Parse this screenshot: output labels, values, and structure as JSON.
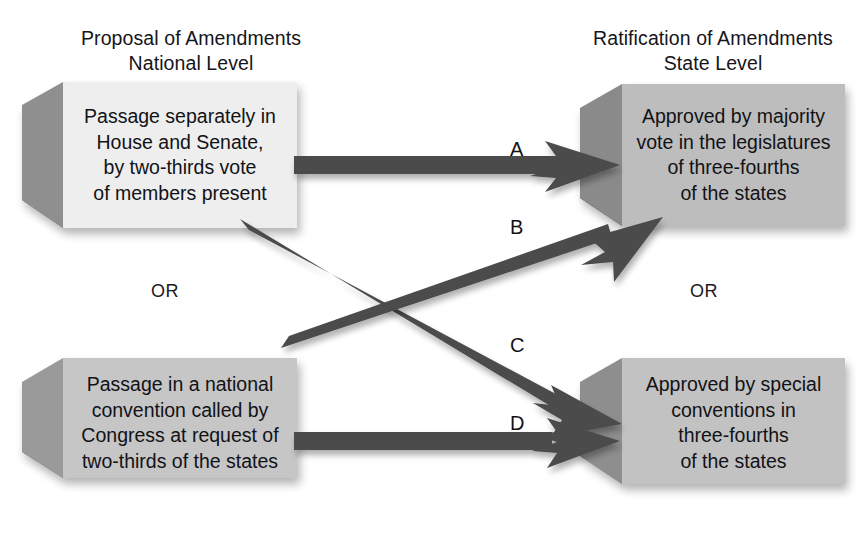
{
  "diagram": {
    "headers": {
      "left": "Proposal of Amendments\nNational Level",
      "right": "Ratification of Amendments\nState Level"
    },
    "connectors": {
      "or_left": "OR",
      "or_right": "OR"
    },
    "boxes": [
      {
        "id": "proposal-congress",
        "side": "left",
        "position": "top",
        "text": "Passage separately in\nHouse and Senate,\nby two-thirds vote\nof members present",
        "face_color": "#eeeeee",
        "side_color": "#8f8f8f",
        "bottom_color": "#4a4a4a"
      },
      {
        "id": "proposal-convention",
        "side": "left",
        "position": "bottom",
        "text": "Passage in a national\nconvention called by\nCongress at request of\ntwo-thirds of the states",
        "face_color": "#c6c6c6",
        "side_color": "#9a9a9a",
        "bottom_color": "#5a5a5a"
      },
      {
        "id": "ratification-legislatures",
        "side": "right",
        "position": "top",
        "text": "Approved by majority\nvote in the legislatures\nof three-fourths\nof the states",
        "face_color": "#bdbdbd",
        "side_color": "#8a8a8a",
        "bottom_color": "#3f3f3f"
      },
      {
        "id": "ratification-conventions",
        "side": "right",
        "position": "bottom",
        "text": "Approved by special\nconventions in\nthree-fourths\nof the states",
        "face_color": "#c2c2c2",
        "side_color": "#8e8e8e",
        "bottom_color": "#6e6e6e"
      }
    ],
    "arrows": [
      {
        "id": "arrow-a",
        "label": "A",
        "from": "proposal-congress",
        "to": "ratification-legislatures",
        "kind": "horizontal"
      },
      {
        "id": "arrow-b",
        "label": "B",
        "from": "proposal-convention",
        "to": "ratification-legislatures",
        "kind": "diagonal-up"
      },
      {
        "id": "arrow-c",
        "label": "C",
        "from": "proposal-congress",
        "to": "ratification-conventions",
        "kind": "diagonal-down"
      },
      {
        "id": "arrow-d",
        "label": "D",
        "from": "proposal-convention",
        "to": "ratification-conventions",
        "kind": "horizontal"
      }
    ],
    "arrow_color": "#4b4b4b"
  }
}
